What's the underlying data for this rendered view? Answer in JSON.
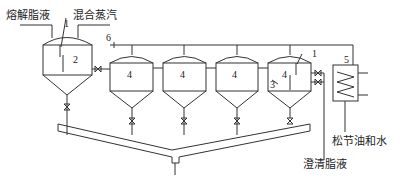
{
  "diagram": {
    "inputs": {
      "melted_fat": "熔解脂液",
      "mixed_steam": "混合蒸汽"
    },
    "outputs": {
      "turpentine_water": "松节油和水",
      "clarified_fat": "澄清脂液"
    },
    "numbers": {
      "n1_left": "1",
      "n2": "2",
      "n6": "6",
      "tank_a": "4",
      "tank_b": "4",
      "tank_c": "4",
      "tank_d": "4",
      "n1_right": "1",
      "n3": "3",
      "n5": "5"
    },
    "colors": {
      "line": "#333333",
      "background": "#ffffff"
    }
  }
}
